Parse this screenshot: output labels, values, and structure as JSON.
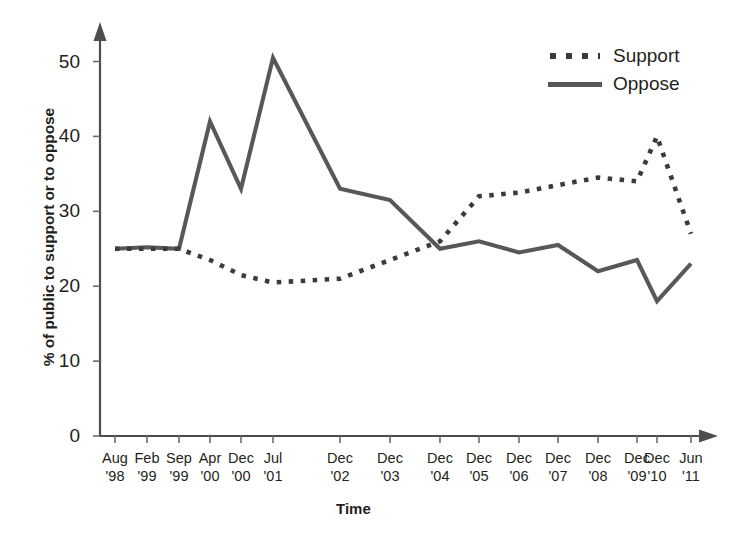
{
  "chart_data": {
    "type": "line",
    "title": "",
    "xlabel": "Time",
    "ylabel": "% of public to support or to oppose",
    "ylim": [
      0,
      55
    ],
    "yticks": [
      0,
      10,
      20,
      30,
      40,
      50
    ],
    "grid": false,
    "legend_position": "top-right",
    "categories": [
      "Aug '98",
      "Feb '99",
      "Sep '99",
      "Apr '00",
      "Dec '00",
      "Jul '01",
      "Dec '02",
      "Dec '03",
      "Dec '04",
      "Dec '05",
      "Dec '06",
      "Dec '07",
      "Dec '08",
      "Dec '09",
      "Dec '10",
      "Jun '11"
    ],
    "category_months": [
      "Aug",
      "Feb",
      "Sep",
      "Apr",
      "Dec",
      "Jul",
      "Dec",
      "Dec",
      "Dec",
      "Dec",
      "Dec",
      "Dec",
      "Dec",
      "Dec",
      "Dec",
      "Jun"
    ],
    "category_years": [
      "'98",
      "'99",
      "'99",
      "'00",
      "'00",
      "'01",
      "'02",
      "'03",
      "'04",
      "'05",
      "'06",
      "'07",
      "'08",
      "'09",
      "'10",
      "'11"
    ],
    "series": [
      {
        "name": "Support",
        "style": "dotted",
        "color": "#3b3b3d",
        "values": [
          25,
          25,
          25,
          23.5,
          21.5,
          20.5,
          21,
          23.5,
          26,
          32,
          32.5,
          33.5,
          34.5,
          34,
          40,
          27
        ]
      },
      {
        "name": "Oppose",
        "style": "solid",
        "color": "#58585a",
        "values": [
          25,
          25.2,
          25,
          42,
          33,
          50.5,
          33,
          31.5,
          25,
          26,
          24.5,
          25.5,
          22,
          23.5,
          18,
          23
        ]
      }
    ]
  },
  "legend": {
    "items": [
      {
        "label": "Support",
        "style": "dotted"
      },
      {
        "label": "Oppose",
        "style": "solid"
      }
    ]
  },
  "axes": {
    "y_label": "% of public to support or to oppose",
    "x_label": "Time",
    "y_tick_labels": [
      "50",
      "40",
      "30",
      "20",
      "10",
      "0"
    ]
  },
  "colors": {
    "support": "#3b3b3d",
    "oppose": "#58585a",
    "axis": "#4d4d4d",
    "text": "#231f20",
    "background": "#ffffff"
  }
}
